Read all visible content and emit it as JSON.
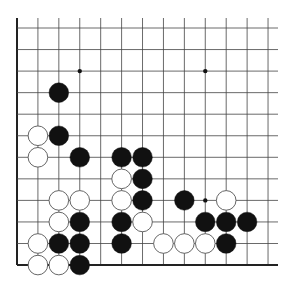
{
  "board": {
    "description": "Go board corner diagram (lower-left region)",
    "origin": {
      "x": 17,
      "y": 28
    },
    "spacing": {
      "x": 20.92,
      "y": 21.55
    },
    "cols": 13,
    "rows": 12,
    "right_extent": 278,
    "edges": {
      "left": true,
      "bottom": true,
      "top": false,
      "right": false
    },
    "colors": {
      "line": "#444444",
      "edge": "#222222",
      "black": "#111111",
      "white": "#ffffff",
      "white_stroke": "#555555"
    },
    "star_points": [
      [
        3,
        2
      ],
      [
        9,
        2
      ],
      [
        9,
        8
      ]
    ],
    "stones": [
      {
        "c": 2,
        "r": 3,
        "color": "black"
      },
      {
        "c": 1,
        "r": 5,
        "color": "white"
      },
      {
        "c": 2,
        "r": 5,
        "color": "black"
      },
      {
        "c": 1,
        "r": 6,
        "color": "white"
      },
      {
        "c": 3,
        "r": 6,
        "color": "black"
      },
      {
        "c": 5,
        "r": 6,
        "color": "black"
      },
      {
        "c": 6,
        "r": 6,
        "color": "black"
      },
      {
        "c": 5,
        "r": 7,
        "color": "white"
      },
      {
        "c": 6,
        "r": 7,
        "color": "black"
      },
      {
        "c": 2,
        "r": 8,
        "color": "white"
      },
      {
        "c": 3,
        "r": 8,
        "color": "white"
      },
      {
        "c": 5,
        "r": 8,
        "color": "white"
      },
      {
        "c": 6,
        "r": 8,
        "color": "black"
      },
      {
        "c": 8,
        "r": 8,
        "color": "black"
      },
      {
        "c": 10,
        "r": 8,
        "color": "white"
      },
      {
        "c": 2,
        "r": 9,
        "color": "white"
      },
      {
        "c": 3,
        "r": 9,
        "color": "black"
      },
      {
        "c": 5,
        "r": 9,
        "color": "black"
      },
      {
        "c": 6,
        "r": 9,
        "color": "white"
      },
      {
        "c": 9,
        "r": 9,
        "color": "black"
      },
      {
        "c": 10,
        "r": 9,
        "color": "black"
      },
      {
        "c": 11,
        "r": 9,
        "color": "black"
      },
      {
        "c": 1,
        "r": 10,
        "color": "white"
      },
      {
        "c": 2,
        "r": 10,
        "color": "black"
      },
      {
        "c": 3,
        "r": 10,
        "color": "black"
      },
      {
        "c": 5,
        "r": 10,
        "color": "black"
      },
      {
        "c": 7,
        "r": 10,
        "color": "white"
      },
      {
        "c": 8,
        "r": 10,
        "color": "white"
      },
      {
        "c": 9,
        "r": 10,
        "color": "white"
      },
      {
        "c": 10,
        "r": 10,
        "color": "black"
      },
      {
        "c": 1,
        "r": 11,
        "color": "white"
      },
      {
        "c": 2,
        "r": 11,
        "color": "white"
      },
      {
        "c": 3,
        "r": 11,
        "color": "black"
      }
    ]
  }
}
